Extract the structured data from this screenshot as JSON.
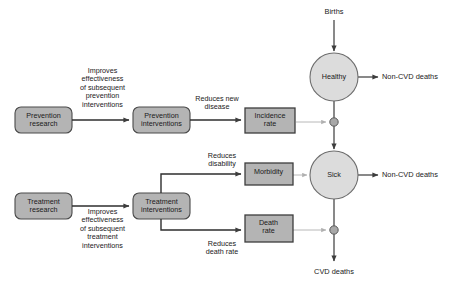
{
  "diagram": {
    "colors": {
      "box_fill": "#b4b4b4",
      "box_stroke": "#4a4a4a",
      "circle_fill": "#dcdcdc",
      "circle_stroke": "#6e6e6e",
      "valve_fill": "#a8a8a8",
      "valve_stroke": "#5a5a5a",
      "flow_line": "#4a4a4a",
      "influence_line": "#b0b0b0",
      "text": "#1a1a1a",
      "background": "#ffffff"
    },
    "rounded_boxes": [
      {
        "id": "prevention-research",
        "label": "Prevention\nresearch"
      },
      {
        "id": "prevention-interventions",
        "label": "Prevention\ninterventions"
      },
      {
        "id": "treatment-research",
        "label": "Treatment\nresearch"
      },
      {
        "id": "treatment-interventions",
        "label": "Treatment\ninterventions"
      }
    ],
    "rate_boxes": [
      {
        "id": "incidence-rate",
        "label": "Incidence\nrate"
      },
      {
        "id": "morbidity",
        "label": "Morbidity"
      },
      {
        "id": "death-rate",
        "label": "Death\nrate"
      }
    ],
    "stock_circles": [
      {
        "id": "healthy",
        "label": "Healthy"
      },
      {
        "id": "sick",
        "label": "Sick"
      }
    ],
    "edge_labels": {
      "prevention_chain": "Improves\neffectiveness\nof subsequent\nprevention\ninterventions",
      "treatment_chain": "Improves\neffectiveness\nof subsequent\ntreatment\ninterventions",
      "reduces_new_disease": "Reduces new\ndisease",
      "reduces_disability": "Reduces\ndisability",
      "reduces_death_rate": "Reduces\ndeath rate"
    },
    "flow_labels": {
      "births": "Births",
      "healthy_non_cvd_deaths": "Non-CVD deaths",
      "sick_non_cvd_deaths": "Non-CVD deaths",
      "cvd_deaths": "CVD deaths"
    }
  }
}
